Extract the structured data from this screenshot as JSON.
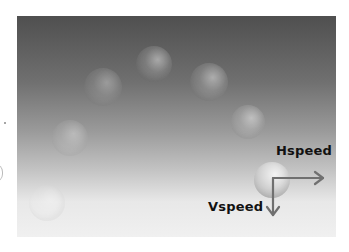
{
  "diagram": {
    "title": "",
    "background": {
      "gradient_top": "#4f4f4f",
      "gradient_mid": "#9a9a9a",
      "gradient_bottom": "#f0f0f0"
    },
    "balls": [
      {
        "id": "ball-0",
        "cx": 47,
        "cy": 203,
        "r": 18,
        "style": "faint"
      },
      {
        "id": "ball-1",
        "cx": 70,
        "cy": 138,
        "r": 18,
        "style": "faint"
      },
      {
        "id": "ball-2",
        "cx": 103,
        "cy": 87,
        "r": 19,
        "style": "faint"
      },
      {
        "id": "ball-3",
        "cx": 154,
        "cy": 64,
        "r": 18,
        "style": "mid"
      },
      {
        "id": "ball-4",
        "cx": 209,
        "cy": 82,
        "r": 19,
        "style": "mid"
      },
      {
        "id": "ball-5",
        "cx": 248,
        "cy": 122,
        "r": 17,
        "style": "mid"
      },
      {
        "id": "ball-6",
        "cx": 272,
        "cy": 180,
        "r": 18,
        "style": "solid"
      }
    ],
    "vectors": {
      "origin": [
        273,
        178
      ],
      "hspeed": {
        "label": "Hspeed",
        "end": [
          323,
          178
        ],
        "color": "#707070"
      },
      "vspeed": {
        "label": "Vspeed",
        "end": [
          273,
          215
        ],
        "color": "#707070"
      }
    }
  }
}
